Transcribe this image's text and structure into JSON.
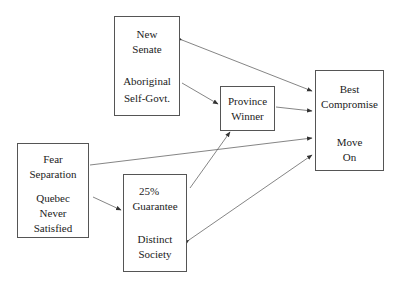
{
  "diagram": {
    "nodes": [
      {
        "id": "new-senate",
        "lines_top": [
          "New",
          "Senate"
        ],
        "lines_bottom": [
          "Aboriginal",
          "Self-Govt."
        ]
      },
      {
        "id": "province-winner",
        "lines_top": [
          "Province",
          "Winner"
        ]
      },
      {
        "id": "best-compromise",
        "lines_top": [
          "Best",
          "Compromise"
        ],
        "lines_bottom": [
          "Move",
          "On"
        ]
      },
      {
        "id": "fear-separation",
        "lines_top": [
          "Fear",
          "Separation"
        ],
        "lines_bottom": [
          "Quebec",
          "Never",
          "Satisfied"
        ]
      },
      {
        "id": "guarantee",
        "lines_top": [
          "25%",
          "Guarantee"
        ],
        "lines_bottom": [
          "Distinct",
          "Society"
        ]
      }
    ],
    "edges": [
      {
        "from": "new-senate",
        "to": "best-compromise",
        "bidirectional": true
      },
      {
        "from": "new-senate",
        "to": "province-winner",
        "bidirectional": false
      },
      {
        "from": "province-winner",
        "to": "best-compromise",
        "bidirectional": false
      },
      {
        "from": "fear-separation",
        "to": "best-compromise",
        "bidirectional": false
      },
      {
        "from": "fear-separation",
        "to": "guarantee",
        "bidirectional": false
      },
      {
        "from": "guarantee",
        "to": "province-winner",
        "bidirectional": false
      },
      {
        "from": "guarantee",
        "to": "best-compromise",
        "bidirectional": true
      }
    ]
  }
}
